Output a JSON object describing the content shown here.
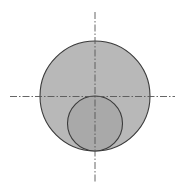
{
  "diagram": {
    "colors": {
      "outer_fill": "#b8b8b8",
      "inner_fill": "#a9a9a9",
      "stroke": "#3a3a3a",
      "axis": "#555555",
      "background": "#ffffff"
    },
    "shapes": [
      {
        "name": "outer-circle",
        "role": "large circle"
      },
      {
        "name": "inner-circle",
        "role": "small circle, internally tangent at bottom, diameter equals outer radius"
      }
    ],
    "axes": [
      {
        "name": "vertical-center-line",
        "style": "dash-dot"
      },
      {
        "name": "horizontal-center-line",
        "style": "dash-dot"
      }
    ]
  }
}
